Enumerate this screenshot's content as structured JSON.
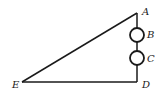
{
  "diagram": {
    "type": "geometry",
    "points": {
      "A": {
        "label": "A",
        "x": 137,
        "y": 13
      },
      "B": {
        "label": "B",
        "x": 137,
        "y": 35
      },
      "C": {
        "label": "C",
        "x": 137,
        "y": 58
      },
      "D": {
        "label": "D",
        "x": 137,
        "y": 82
      },
      "E": {
        "label": "E",
        "x": 22,
        "y": 82
      }
    },
    "segments": [
      [
        "A",
        "E"
      ],
      [
        "E",
        "D"
      ],
      [
        "D",
        "A"
      ]
    ],
    "circles": [
      {
        "center": "B",
        "r": 7
      },
      {
        "center": "C",
        "r": 7
      }
    ],
    "colors": {
      "stroke": "#1a1a1a",
      "background": "#ffffff"
    }
  }
}
